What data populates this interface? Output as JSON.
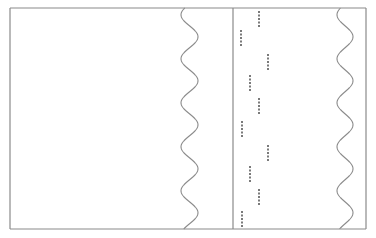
{
  "colors": {
    "background": "#ffffff",
    "frame": "#8a8a8a",
    "wave": "#8c8c8c",
    "dots": "#7a7a7a"
  },
  "frame": {
    "x": 10,
    "y": 8,
    "width": 356,
    "height": 221
  },
  "divider": {
    "x": 233
  },
  "waves": [
    {
      "name": "left-torn-edge",
      "center_x": 189.5,
      "amplitude": 8.5,
      "period": 44,
      "phase_start": "left"
    },
    {
      "name": "right-torn-edge",
      "center_x": 345,
      "amplitude": 8,
      "period": 44,
      "phase_start": "left"
    }
  ],
  "dot_groups": [
    {
      "x": 259,
      "y": 11,
      "count": 5
    },
    {
      "x": 241,
      "y": 30,
      "count": 5
    },
    {
      "x": 268,
      "y": 54,
      "count": 5
    },
    {
      "x": 250,
      "y": 75,
      "count": 5
    },
    {
      "x": 259,
      "y": 98,
      "count": 5
    },
    {
      "x": 242,
      "y": 121,
      "count": 5
    },
    {
      "x": 268,
      "y": 145,
      "count": 5
    },
    {
      "x": 250,
      "y": 166,
      "count": 5
    },
    {
      "x": 259,
      "y": 189,
      "count": 5
    },
    {
      "x": 242,
      "y": 211,
      "count": 5
    }
  ]
}
